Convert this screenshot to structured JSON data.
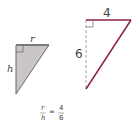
{
  "small_triangle": {
    "top_label": "r",
    "side_label": "h",
    "fill": "#c9c5c8",
    "stroke": "#6d6a6c"
  },
  "large_triangle": {
    "top_label": "4",
    "side_label": "6",
    "edge_color": "#8c2245",
    "dashed_color": "#9a9a9a"
  },
  "equation": {
    "left_num": "r",
    "left_den": "h",
    "equals": "=",
    "right_num": "4",
    "right_den": "6"
  }
}
